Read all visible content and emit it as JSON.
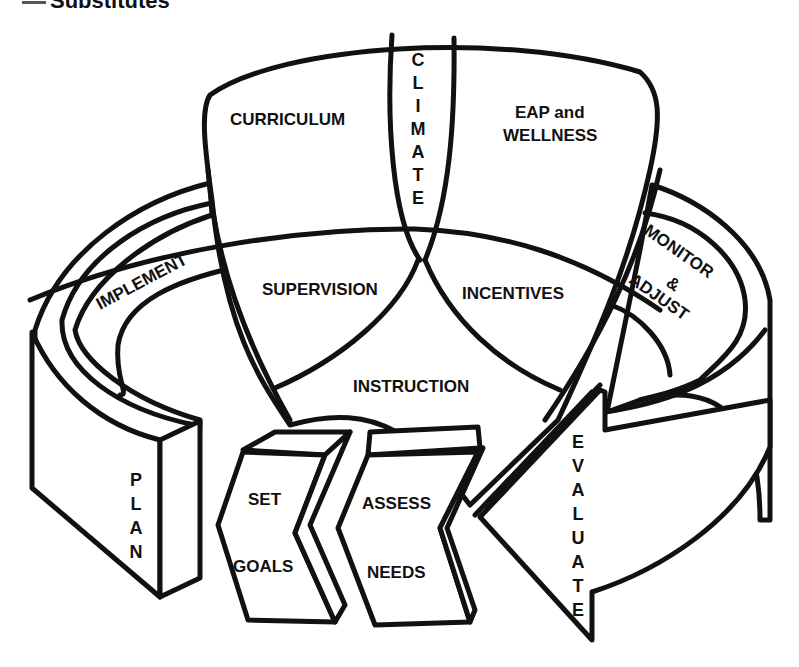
{
  "header": {
    "title": "Substitutes"
  },
  "diagram": {
    "top_regions": {
      "curriculum": "CURRICULUM",
      "climate": [
        "C",
        "L",
        "I",
        "M",
        "A",
        "T",
        "E"
      ],
      "eap_line1": "EAP and",
      "eap_line2": "WELLNESS"
    },
    "middle_regions": {
      "supervision": "SUPERVISION",
      "incentives": "INCENTIVES",
      "instruction": "INSTRUCTION"
    },
    "cycle": {
      "implement": "IMPLEMENT",
      "monitor_line1": "MONITOR",
      "monitor_line2": "&",
      "monitor_line3": "ADJUST",
      "plan": [
        "P",
        "L",
        "A",
        "N"
      ],
      "evaluate": [
        "E",
        "V",
        "A",
        "L",
        "U",
        "A",
        "T",
        "E"
      ],
      "set_goals_line1": "SET",
      "set_goals_line2": "GOALS",
      "assess_line1": "ASSESS",
      "assess_line2": "NEEDS"
    }
  }
}
